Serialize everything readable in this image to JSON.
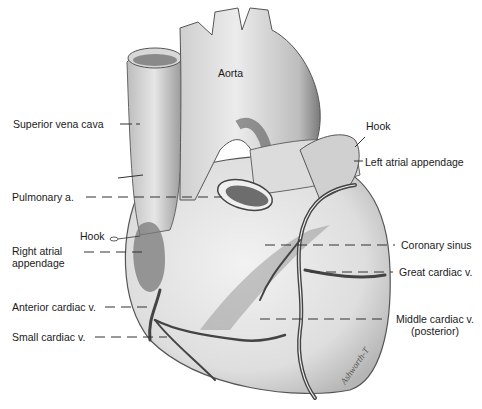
{
  "figure": {
    "signature": "Ashworth-T"
  },
  "labels": {
    "aorta": "Aorta",
    "superior_vena_cava": "Superior vena cava",
    "pulmonary_a": "Pulmonary a.",
    "hook_right": "Hook",
    "right_atrial_appendage_1": "Right atrial",
    "right_atrial_appendage_2": "appendage",
    "anterior_cardiac_v": "Anterior cardiac v.",
    "small_cardiac_v": "Small cardiac v.",
    "hook_left": "Hook",
    "left_atrial_appendage": "Left atrial appendage",
    "coronary_sinus": "Coronary sinus",
    "great_cardiac_v": "Great cardiac v.",
    "middle_cardiac_v_1": "Middle cardiac v.",
    "middle_cardiac_v_2": "(posterior)"
  }
}
